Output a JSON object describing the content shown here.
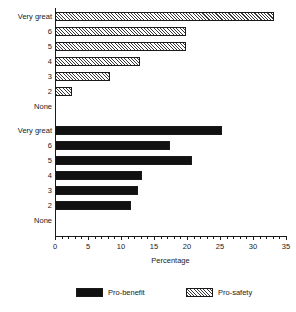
{
  "chart_data": {
    "type": "bar",
    "orientation": "horizontal",
    "title": "",
    "xlabel": "Percentage",
    "ylabel": "",
    "xlim": [
      0,
      35
    ],
    "xticks": [
      0,
      5,
      10,
      15,
      20,
      25,
      30,
      35
    ],
    "xtick_labels": [
      "0",
      "5",
      "10",
      "15",
      "20",
      "25",
      "30",
      "35"
    ],
    "minor_tick_step": 1,
    "grid": false,
    "legend_position": "bottom",
    "categories": [
      "Very great",
      "6",
      "5",
      "4",
      "3",
      "2",
      "None"
    ],
    "series": [
      {
        "name": "Pro-safety",
        "fill": "hatched",
        "color": "#ffffff",
        "values": [
          33.2,
          19.9,
          19.9,
          12.9,
          8.3,
          2.6,
          0
        ]
      },
      {
        "name": "Pro-benefit",
        "fill": "solid",
        "color": "#111111",
        "values": [
          25.3,
          17.4,
          20.8,
          13.2,
          12.6,
          11.5,
          0
        ]
      }
    ]
  },
  "legend": {
    "entries": [
      {
        "label": "Pro-benefit",
        "swatch": "solid-black-swatch"
      },
      {
        "label": "Pro-safety",
        "swatch": "hatched-swatch"
      }
    ]
  },
  "axis": {
    "x_title": "Percentage"
  }
}
